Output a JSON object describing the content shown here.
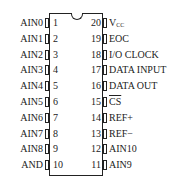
{
  "diagram": {
    "type": "ic-pinout",
    "package": "DIP-20",
    "pins_left": [
      {
        "num": "1",
        "label": "AIN0"
      },
      {
        "num": "2",
        "label": "AIN1"
      },
      {
        "num": "3",
        "label": "AIN2"
      },
      {
        "num": "4",
        "label": "AIN3"
      },
      {
        "num": "5",
        "label": "AIN4"
      },
      {
        "num": "6",
        "label": "AIN5"
      },
      {
        "num": "7",
        "label": "AIN6"
      },
      {
        "num": "8",
        "label": "AIN7"
      },
      {
        "num": "9",
        "label": "AIN8"
      },
      {
        "num": "10",
        "label": "AND"
      }
    ],
    "pins_right": [
      {
        "num": "20",
        "label": "V",
        "sub": "CC"
      },
      {
        "num": "19",
        "label": "EOC"
      },
      {
        "num": "18",
        "label": "I/O CLOCK"
      },
      {
        "num": "17",
        "label": "DATA INPUT"
      },
      {
        "num": "16",
        "label": "DATA OUT"
      },
      {
        "num": "15",
        "label": "CS",
        "overline": true
      },
      {
        "num": "14",
        "label": "REF+"
      },
      {
        "num": "13",
        "label": "REF−"
      },
      {
        "num": "12",
        "label": "AIN10"
      },
      {
        "num": "11",
        "label": "AIN9"
      }
    ]
  }
}
